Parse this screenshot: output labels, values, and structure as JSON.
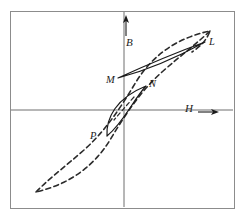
{
  "figure": {
    "background_color": "#ffffff",
    "frame": {
      "name": "figure-border",
      "color": "#8c8c8c",
      "x": 10,
      "y": 11,
      "width": 224,
      "height": 197
    }
  },
  "axes": {
    "color": "#6e6e6e",
    "origin": {
      "x": 124,
      "y": 110
    },
    "horizontal": {
      "label": "H",
      "arrow": "→",
      "label_x": 188,
      "label_y": 108,
      "line": {
        "x1": 11,
        "y1": 110,
        "x2": 233,
        "y2": 110
      }
    },
    "vertical": {
      "label": "B",
      "arrow": "↑",
      "label_x": 126,
      "label_y": 37,
      "line": {
        "x1": 124,
        "y1": 12,
        "x2": 124,
        "y2": 207
      },
      "arrow_marker": {
        "x": 126,
        "y_tail": 36,
        "y_head": 17
      }
    }
  },
  "curves": [
    {
      "name": "major-loop",
      "style": "dashed",
      "color": "#2b2b2b",
      "stroke_width": 1.6,
      "dash_pattern": "5,3.4",
      "description": "Outer major hysteresis loop, saturating S-shape",
      "upper_branch": "M 36,192 C 52,176 66,166 84,150 C 104,132 118,112 136,82 C 152,56 176,38 210,31 C 206,42 198,48 192,52",
      "lower_branch": "M 210,31 C 194,46 180,56 162,72 C 142,90 128,110 110,140 C 94,166 70,184 36,192"
    },
    {
      "name": "minor-loop-LM",
      "style": "solid",
      "color": "#1a1a1a",
      "stroke_width": 1.2,
      "description": "Narrow upper minor loop between tip L and tip M",
      "tip_start": {
        "label": "M",
        "x": 118,
        "y": 78
      },
      "tip_end": {
        "label": "L",
        "x": 205,
        "y": 42
      },
      "path": "M 118,78 C 140,68 172,54 205,42 C 176,58 148,70 118,78 Z"
    },
    {
      "name": "minor-loop-NP",
      "style": "solid",
      "color": "#1a1a1a",
      "stroke_width": 1.2,
      "description": "Small lens-shaped minor loop between tip N and tip P",
      "tip_start": {
        "label": "P",
        "x": 107,
        "y": 136
      },
      "tip_end": {
        "label": "N",
        "x": 146,
        "y": 86
      },
      "path": "M 107,136 C 106,118 116,98 146,86 C 133,100 124,122 107,136 Z"
    },
    {
      "name": "minor-loop-NP-inner-dashed",
      "style": "dashed",
      "color": "#2b2b2b",
      "stroke_width": 1.2,
      "dash_pattern": "4,3",
      "description": "Dashed segment of major loop passing through the small minor loop",
      "path": "M 134,97 C 126,106 120,113 114,120"
    }
  ],
  "labels": [
    {
      "name": "label-B",
      "text": "B",
      "x": 126,
      "y": 37,
      "kind": "axis"
    },
    {
      "name": "label-H",
      "text": "H",
      "x": 188,
      "y": 108,
      "kind": "axis"
    },
    {
      "name": "label-L",
      "text": "L",
      "x": 209,
      "y": 42,
      "kind": "point"
    },
    {
      "name": "label-M",
      "text": "M",
      "x": 108,
      "y": 80,
      "kind": "point"
    },
    {
      "name": "label-N",
      "text": "N",
      "x": 150,
      "y": 84,
      "kind": "point"
    },
    {
      "name": "label-P",
      "text": "P",
      "x": 92,
      "y": 136,
      "kind": "point"
    }
  ]
}
